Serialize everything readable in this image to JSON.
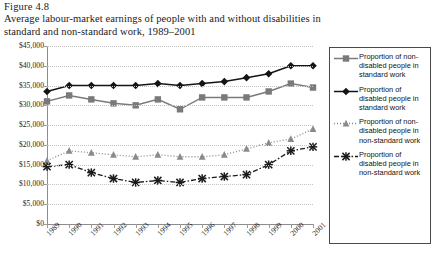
{
  "figure": {
    "label": "Figure 4.8",
    "title": "Average labour-market earnings of people with and without disabilities in standard and non-standard work, 1989–2001"
  },
  "legend": {
    "items": [
      {
        "key": "square-solid-line-key",
        "label": "Proportion of non-disabled people in standard work",
        "color": "#7a7a7a"
      },
      {
        "key": "diamond-solid-line-key",
        "label": "Proportion of disabled people in standard work",
        "color": "#141414"
      },
      {
        "key": "triangle-dotted-line-key",
        "label": "Proportion of non-disabled people in non-standard work",
        "color": "#8a8a8a"
      },
      {
        "key": "cross-dashdot-line-key",
        "label": "Proportion of disabled people in non-standard work",
        "color": "#1a1a1a"
      }
    ]
  },
  "chart_data": {
    "type": "line",
    "title": "Average labour-market earnings of people with and without disabilities in standard and non-standard work, 1989–2001",
    "xlabel": "",
    "ylabel": "",
    "grid": true,
    "legend_position": "right",
    "x": [
      1989,
      1990,
      1991,
      1992,
      1993,
      1994,
      1995,
      1996,
      1997,
      1998,
      1999,
      2000,
      2001
    ],
    "categories": [
      "1989",
      "1990",
      "1991",
      "1992",
      "1993",
      "1994",
      "1995",
      "1996",
      "1997",
      "1998",
      "1999",
      "2000",
      "2001"
    ],
    "ylim": [
      0,
      45000
    ],
    "yticks": [
      0,
      5000,
      10000,
      15000,
      20000,
      25000,
      30000,
      35000,
      40000,
      45000
    ],
    "ytick_labels": [
      "$0",
      "$5,000",
      "$10,000",
      "$15,000",
      "$20,000",
      "$25,000",
      "$30,000",
      "$35,000",
      "$40,000",
      "$45,000"
    ],
    "series": [
      {
        "name": "Proportion of non-disabled people in standard work",
        "marker": "square",
        "line_style": "solid",
        "color": "#7a7a7a",
        "values": [
          31000,
          32500,
          31500,
          30500,
          30000,
          31500,
          29000,
          32000,
          32000,
          32000,
          33500,
          35500,
          34500
        ]
      },
      {
        "name": "Proportion of disabled people in standard work",
        "marker": "diamond",
        "line_style": "solid",
        "color": "#141414",
        "values": [
          33500,
          35000,
          35000,
          35000,
          35000,
          35500,
          35000,
          35500,
          36000,
          37000,
          38000,
          40000,
          40000
        ]
      },
      {
        "name": "Proportion of non-disabled people in non-standard work",
        "marker": "triangle",
        "line_style": "dotted",
        "color": "#8a8a8a",
        "values": [
          16000,
          18500,
          18000,
          17500,
          17000,
          17500,
          17000,
          17000,
          17500,
          19000,
          20500,
          21500,
          24000
        ]
      },
      {
        "name": "Proportion of disabled people in non-standard work",
        "marker": "cross",
        "line_style": "dashdot",
        "color": "#1a1a1a",
        "values": [
          14500,
          15000,
          13000,
          11500,
          10500,
          11000,
          10500,
          11500,
          12000,
          12500,
          15000,
          18500,
          19500
        ]
      }
    ]
  }
}
